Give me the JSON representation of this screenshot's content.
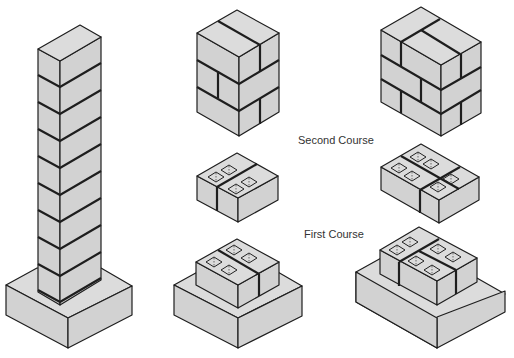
{
  "diagram": {
    "labels": {
      "second_course": "Second Course",
      "first_course": "First Course"
    },
    "colors": {
      "block_fill": "#d2d2d2",
      "outline": "#1e1e1e",
      "background": "#ffffff",
      "label_text": "#333333"
    },
    "figures": [
      {
        "id": "tall-pillar",
        "description": "Tall brick pillar with 9 courses on concrete footing"
      },
      {
        "id": "small-brick-column",
        "description": "Brick column, 3 courses, running bond (2-wide)"
      },
      {
        "id": "large-brick-column",
        "description": "Brick column, 3 courses, running bond (3-wide)"
      },
      {
        "id": "small-second-course",
        "description": "Second course of 2 hollow concrete blocks"
      },
      {
        "id": "large-second-course",
        "description": "Second course of 3 hollow concrete blocks"
      },
      {
        "id": "small-first-course-footing",
        "description": "First course of 2 blocks on footing"
      },
      {
        "id": "large-first-course-footing",
        "description": "First course of 3 blocks on footing"
      }
    ]
  }
}
